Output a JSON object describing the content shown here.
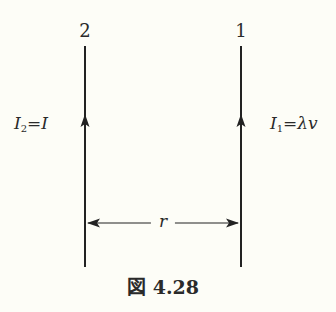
{
  "diagram": {
    "wires": [
      {
        "id": "2",
        "label": "2",
        "x": 85,
        "current_label": {
          "base": "I",
          "sub": "2",
          "rhs": "=I"
        },
        "direction": "up"
      },
      {
        "id": "1",
        "label": "1",
        "x": 241,
        "current_label": {
          "base": "I",
          "sub": "1",
          "rhs": "=λv"
        },
        "direction": "up"
      }
    ],
    "separation_label": "r",
    "caption": "図 4.28",
    "colors": {
      "line": "#222222",
      "background": "#fdfdf7"
    }
  }
}
